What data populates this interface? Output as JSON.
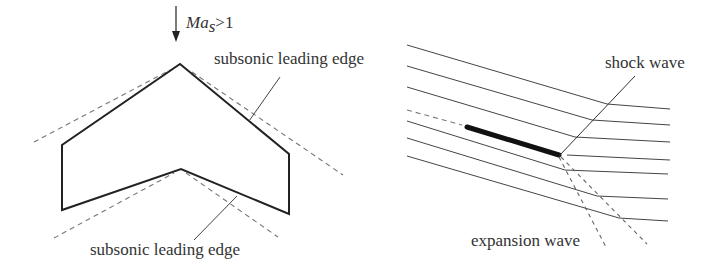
{
  "figure": {
    "left_panel": {
      "flow_arrow": {
        "label_main": "Ma",
        "label_sub": "s",
        "label_rest": ">1"
      },
      "labels": {
        "top": "subsonic leading edge",
        "bottom": "subsonic leading edge"
      }
    },
    "right_panel": {
      "labels": {
        "shock": "shock wave",
        "expansion": "expansion wave"
      }
    }
  },
  "colors": {
    "background": "#ffffff",
    "line": "#222222",
    "dashed": "#777777",
    "text": "#333333"
  }
}
